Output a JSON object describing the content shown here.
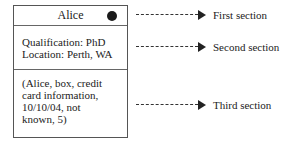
{
  "box": {
    "sections": [
      {
        "title": "Alice",
        "has_dot": true
      },
      {
        "lines": "Qualification: PhD\nLocation: Perth, WA"
      },
      {
        "lines": "(Alice, box, credit\ncard information,\n10/10/04, not\nknown, 5)"
      }
    ]
  },
  "annotations": [
    {
      "label": "First section",
      "y": 15
    },
    {
      "label": "Second section",
      "y": 47
    },
    {
      "label": "Third section",
      "y": 105
    }
  ],
  "colors": {
    "line": "#333333",
    "dot": "#1a1a1a",
    "text": "#222222"
  }
}
